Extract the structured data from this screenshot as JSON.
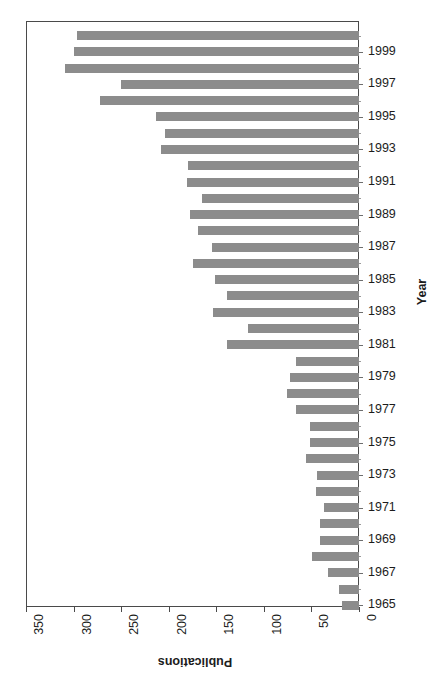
{
  "chart_data": {
    "type": "bar",
    "orientation": "horizontal-reversed",
    "title": "",
    "xlabel": "Publications",
    "ylabel": "Year",
    "xlim": [
      0,
      350
    ],
    "xlim_direction": "right-to-left",
    "xticks": [
      350,
      300,
      250,
      200,
      150,
      100,
      50,
      0
    ],
    "xticklabels": [
      "350",
      "300",
      "250",
      "200",
      "150",
      "100",
      "50",
      "0"
    ],
    "grid": false,
    "legend": null,
    "bar_color": "#8c8c8c",
    "axis_color": "#4a4a4a",
    "categories": [
      "2000",
      "1999",
      "1998",
      "1997",
      "1996",
      "1995",
      "1994",
      "1993",
      "1992",
      "1991",
      "1990",
      "1989",
      "1988",
      "1987",
      "1986",
      "1985",
      "1984",
      "1983",
      "1982",
      "1981",
      "1980",
      "1979",
      "1978",
      "1977",
      "1976",
      "1975",
      "1974",
      "1973",
      "1972",
      "1971",
      "1970",
      "1969",
      "1968",
      "1967",
      "1966",
      "1965"
    ],
    "values": [
      296,
      300,
      309,
      250,
      272,
      213,
      204,
      208,
      180,
      181,
      165,
      178,
      169,
      155,
      175,
      151,
      139,
      153,
      117,
      139,
      66,
      73,
      76,
      66,
      52,
      52,
      56,
      44,
      45,
      37,
      41,
      41,
      49,
      33,
      21,
      18
    ],
    "yticklabels": [
      "1999",
      "1997",
      "1995",
      "1993",
      "1991",
      "1989",
      "1987",
      "1985",
      "1983",
      "1981",
      "1979",
      "1977",
      "1975",
      "1973",
      "1971",
      "1969",
      "1967",
      "1965"
    ]
  }
}
